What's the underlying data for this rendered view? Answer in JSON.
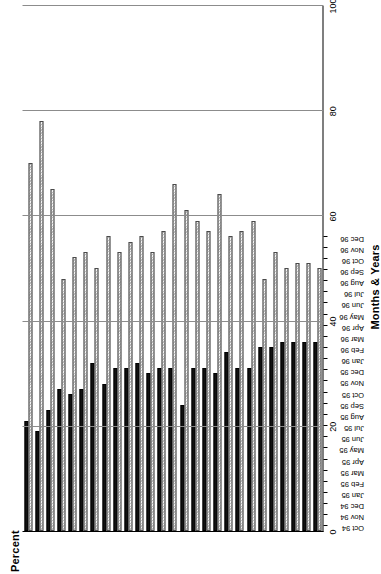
{
  "chart_data": {
    "type": "bar",
    "orientation": "vertical-grouped-rendered-sideways",
    "title": "",
    "xlabel": "Months & Years",
    "ylabel": "Percent",
    "ylim": [
      0,
      100
    ],
    "yticks": [
      0,
      20,
      40,
      60,
      80,
      100
    ],
    "ytick_labels": [
      "0",
      "20",
      "40",
      "60",
      "80",
      "100"
    ],
    "grid": true,
    "legend": "none",
    "categories": [
      "Oct 94",
      "Nov 94",
      "Dec 94",
      "Jan 95",
      "Feb 95",
      "Mar 95",
      "Apr 95",
      "May 95",
      "Jun 95",
      "Jul 95",
      "Aug 95",
      "Sep 95",
      "Oct 95",
      "Nov 95",
      "Dec 95",
      "Jan 96",
      "Feb 96",
      "Mar 96",
      "Apr 96",
      "May 96",
      "Jun 96",
      "Jul 96",
      "Aug 96",
      "Sep 96",
      "Oct 96",
      "Nov 96",
      "Dec 96"
    ],
    "category_month_labels": [
      "Oct",
      "Nov",
      "Dec",
      "Jan",
      "Feb",
      "Mar",
      "Apr",
      "May",
      "Jun",
      "Jul",
      "Aug",
      "Sep",
      "Oct",
      "Nov",
      "Dec",
      "Jan",
      "Feb",
      "Mar",
      "Apr",
      "May",
      "Jun",
      "Jul",
      "Aug",
      "Sep",
      "Oct",
      "Nov",
      "Dec"
    ],
    "category_year_labels": [
      "94",
      "94",
      "94",
      "95",
      "95",
      "95",
      "95",
      "95",
      "95",
      "95",
      "95",
      "95",
      "95",
      "95",
      "95",
      "96",
      "96",
      "96",
      "96",
      "96",
      "96",
      "96",
      "96",
      "96",
      "96",
      "96",
      "96"
    ],
    "series": [
      {
        "name": "dark-series",
        "style": "solid-black",
        "color": "#111111",
        "values": [
          21,
          19,
          23,
          27,
          26,
          27,
          32,
          28,
          31,
          31,
          32,
          30,
          31,
          31,
          24,
          31,
          31,
          30,
          34,
          31,
          31,
          35,
          35,
          36,
          36,
          36,
          36
        ]
      },
      {
        "name": "light-series",
        "style": "hatched-gray",
        "color": "#b9b9b9",
        "values": [
          70,
          78,
          65,
          48,
          52,
          53,
          50,
          56,
          53,
          55,
          56,
          53,
          57,
          66,
          61,
          59,
          57,
          64,
          56,
          57,
          59,
          48,
          53,
          50,
          51,
          51,
          50
        ]
      }
    ]
  },
  "axes": {
    "percent_title": "Percent",
    "months_title": "Months & Years"
  }
}
